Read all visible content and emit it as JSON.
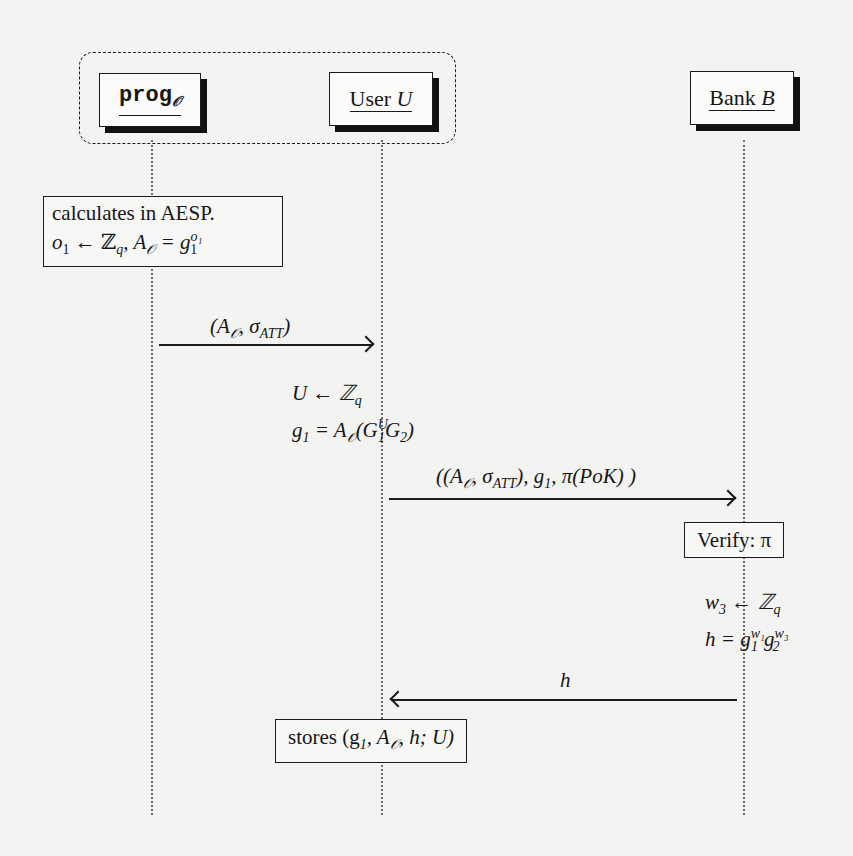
{
  "diagram": {
    "type": "sequence-diagram",
    "actors": [
      {
        "id": "prog",
        "label": "prog",
        "subscript": "𝒪"
      },
      {
        "id": "user",
        "label": "User ",
        "label_italic": "U"
      },
      {
        "id": "bank",
        "label": "Bank ",
        "label_italic": "B"
      }
    ],
    "group": {
      "members": [
        "prog",
        "user"
      ],
      "style": "dashed-rounded"
    },
    "notes": {
      "prog_calc": {
        "line1": "calculates in AESP.",
        "line2_a": "o",
        "line2_a_sub": "1",
        "line2_b": " ← ℤ",
        "line2_b_sub": "q",
        "line2_c": ", A",
        "line2_c_sub": "𝒪",
        "line2_d": " = g",
        "line2_d_sup": "o₁",
        "line2_d_sub": "1"
      },
      "user_calc": {
        "line1_a": "U ← ℤ",
        "line1_a_sub": "q",
        "line2_a": "g",
        "line2_a_sub": "1",
        "line2_b": " = A",
        "line2_b_sub": "𝒪",
        "line2_c": "(G",
        "line2_c_sup": "U",
        "line2_c_sub": "1",
        "line2_d": "G",
        "line2_d_sub": "2",
        "line2_e": ")"
      },
      "bank_verify": {
        "text": "Verify: π"
      },
      "bank_calc": {
        "line1_a": "w",
        "line1_a_sub": "3",
        "line1_b": " ← ℤ",
        "line1_b_sub": "q",
        "line2_a": "h = g",
        "line2_a_sup": "w₁",
        "line2_a_sub": "1",
        "line2_b": "g",
        "line2_b_sup": "w₃",
        "line2_b_sub": "2"
      },
      "user_store": {
        "text_a": "stores (g",
        "text_a_sub": "1",
        "text_b": ", A",
        "text_b_sub": "𝒪",
        "text_c": ", h; U)"
      }
    },
    "messages": [
      {
        "from": "prog",
        "to": "user",
        "label_a": "(A",
        "label_a_sub": "𝒪",
        "label_b": ", σ",
        "label_b_sub": "ATT",
        "label_c": ")"
      },
      {
        "from": "user",
        "to": "bank",
        "label_a": "((A",
        "label_a_sub": "𝒪",
        "label_b": ", σ",
        "label_b_sub": "ATT",
        "label_c": "), g",
        "label_c_sub": "1",
        "label_d": ", π(PoK) )"
      },
      {
        "from": "bank",
        "to": "user",
        "label": "h"
      }
    ]
  }
}
